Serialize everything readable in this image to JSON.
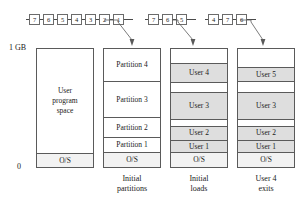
{
  "axis": {
    "top_label": "1 GB",
    "bottom_label": "0"
  },
  "queues": [
    {
      "name": "queue-initial-partitions",
      "items": [
        "7",
        "6",
        "5",
        "4",
        "3",
        "2",
        "1"
      ]
    },
    {
      "name": "queue-initial-loads",
      "items": [
        "7",
        "6",
        "5"
      ]
    },
    {
      "name": "queue-user-4-exits",
      "items": [
        "4",
        "7",
        "6"
      ]
    }
  ],
  "columns": [
    {
      "name": "memory-user-program-space",
      "caption": "",
      "bands": [
        {
          "label": "User\nprogram\nspace",
          "lines": [
            "User",
            "program",
            "space"
          ],
          "style": "plain"
        },
        {
          "label": "O/S",
          "style": "os"
        }
      ]
    },
    {
      "name": "memory-initial-partitions",
      "caption": "Initial\npartitions",
      "caption_lines": [
        "Initial",
        "partitions"
      ],
      "bands": [
        {
          "label": "Partition 4",
          "style": "plain"
        },
        {
          "label": "Partition 3",
          "style": "plain"
        },
        {
          "label": "Partition 2",
          "style": "plain"
        },
        {
          "label": "Partition 1",
          "style": "plain"
        },
        {
          "label": "O/S",
          "style": "os"
        }
      ]
    },
    {
      "name": "memory-initial-loads",
      "caption": "Initial\nloads",
      "caption_lines": [
        "Initial",
        "loads"
      ],
      "bands": [
        {
          "label": "",
          "style": "gap"
        },
        {
          "label": "User 4",
          "style": "shaded"
        },
        {
          "label": "",
          "style": "gap"
        },
        {
          "label": "User 3",
          "style": "shaded"
        },
        {
          "label": "",
          "style": "gap"
        },
        {
          "label": "User 2",
          "style": "shaded"
        },
        {
          "label": "User 1",
          "style": "shaded"
        },
        {
          "label": "O/S",
          "style": "os"
        }
      ]
    },
    {
      "name": "memory-user-4-exits",
      "caption": "User 4\nexits",
      "caption_lines": [
        "User 4",
        "exits"
      ],
      "bands": [
        {
          "label": "",
          "style": "gap"
        },
        {
          "label": "User 5",
          "style": "shaded"
        },
        {
          "label": "",
          "style": "gap"
        },
        {
          "label": "User 3",
          "style": "shaded"
        },
        {
          "label": "",
          "style": "gap"
        },
        {
          "label": "User 2",
          "style": "shaded"
        },
        {
          "label": "User 1",
          "style": "shaded"
        },
        {
          "label": "O/S",
          "style": "os"
        }
      ]
    }
  ],
  "colors": {
    "stroke": "#5a5a5a",
    "shaded_fill": "#dedede",
    "os_fill": "#f2f2f2",
    "background": "#ffffff",
    "text": "#1a1a1a"
  }
}
